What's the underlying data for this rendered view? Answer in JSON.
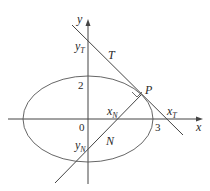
{
  "diagram": {
    "type": "ellipse-tangent-normal",
    "ellipse": {
      "semi_major_label": "3",
      "semi_minor_label": "2"
    },
    "labels": {
      "x_axis": "x",
      "y_axis": "y",
      "origin": "0",
      "x_intercept": "3",
      "y_intercept": "2",
      "tangent": "T",
      "normal": "N",
      "point": "P",
      "tangent_y_intercept": "y",
      "tangent_y_intercept_sub": "T",
      "tangent_x_intercept": "x",
      "tangent_x_intercept_sub": "T",
      "normal_x_intercept": "x",
      "normal_x_intercept_sub": "N",
      "normal_y_intercept": "y",
      "normal_y_intercept_sub": "N"
    },
    "colors": {
      "stroke": "#444444",
      "text": "#2a2a2a",
      "background": "#ffffff"
    }
  }
}
